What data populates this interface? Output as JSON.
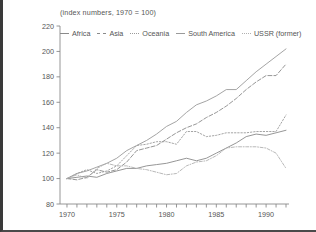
{
  "chart_data": {
    "type": "line",
    "title": "",
    "subtitle": "(index numbers, 1970 = 100)",
    "xlabel": "",
    "ylabel": "",
    "xlim": [
      1969.3,
      1992.3
    ],
    "ylim": [
      80,
      220
    ],
    "yticks": [
      80,
      100,
      120,
      140,
      160,
      180,
      200,
      220
    ],
    "ytick_labels": [
      "80",
      "100",
      "120",
      "140",
      "160",
      "180",
      "200",
      "220"
    ],
    "xticks": [
      1970,
      1971,
      1972,
      1973,
      1974,
      1975,
      1976,
      1977,
      1978,
      1979,
      1980,
      1981,
      1982,
      1983,
      1984,
      1985,
      1986,
      1987,
      1988,
      1989,
      1990,
      1991,
      1992
    ],
    "xtick_labels": [
      "1970",
      "",
      "",
      "",
      "",
      "1975",
      "",
      "",
      "",
      "",
      "1980",
      "",
      "",
      "",
      "",
      "1985",
      "",
      "",
      "",
      "",
      "1990",
      "",
      ""
    ],
    "grid": false,
    "legend_position": "top-inside",
    "x": [
      1970,
      1971,
      1972,
      1973,
      1974,
      1975,
      1976,
      1977,
      1978,
      1979,
      1980,
      1981,
      1982,
      1983,
      1984,
      1985,
      1986,
      1987,
      1988,
      1989,
      1990,
      1991,
      1992
    ],
    "series": [
      {
        "name": "Africa",
        "color": "#8a8a8a",
        "dash": "solid",
        "values": [
          100,
          101,
          102,
          101,
          104,
          106,
          108,
          108,
          110,
          111,
          112,
          114,
          116,
          114,
          116,
          120,
          124,
          128,
          133,
          135,
          134,
          136,
          138
        ]
      },
      {
        "name": "Asia",
        "color": "#8a8a8a",
        "dash": "dashed",
        "values": [
          100,
          99,
          101,
          107,
          105,
          107,
          113,
          122,
          124,
          126,
          131,
          136,
          140,
          143,
          148,
          152,
          157,
          163,
          170,
          176,
          181,
          181,
          190
        ]
      },
      {
        "name": "Oceania",
        "color": "#9a9a9a",
        "dash": "dotted",
        "values": [
          100,
          104,
          107,
          104,
          106,
          110,
          118,
          126,
          127,
          129,
          129,
          127,
          137,
          137,
          133,
          134,
          136,
          136,
          136,
          137,
          137,
          137,
          150
        ]
      },
      {
        "name": "South America",
        "color": "#9a9a9a",
        "dash": "solid",
        "values": [
          100,
          104,
          106,
          109,
          112,
          116,
          122,
          126,
          130,
          135,
          141,
          145,
          152,
          158,
          161,
          165,
          170,
          170,
          177,
          184,
          190,
          196,
          202
        ]
      },
      {
        "name": "USSR (former)",
        "color": "#b0b0b0",
        "dash": "dash-dot",
        "values": [
          100,
          103,
          100,
          108,
          112,
          110,
          110,
          108,
          107,
          105,
          103,
          104,
          110,
          113,
          114,
          118,
          124,
          125,
          125,
          125,
          124,
          120,
          108
        ]
      }
    ]
  }
}
